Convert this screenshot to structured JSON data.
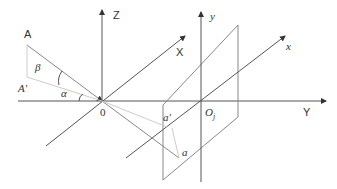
{
  "diagram": {
    "type": "3d-coordinate-projection",
    "labels": {
      "point_A": "A",
      "point_A_prime": "A'",
      "angle_beta": "β",
      "angle_alpha": "α",
      "origin": "0",
      "axis_Z": "Z",
      "axis_X": "X",
      "axis_Y": "Y",
      "axis_y": "y",
      "axis_x": "x",
      "origin_plane": "O",
      "origin_plane_sub": "j",
      "point_a_prime": "a'",
      "point_a": "a"
    },
    "colors": {
      "axis": "#444444",
      "plane": "#888888",
      "light_line": "#bbbbbb"
    }
  }
}
